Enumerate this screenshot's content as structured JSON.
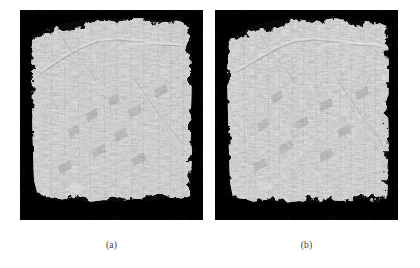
{
  "figure": {
    "type": "two-panel-grayscale-micrograph",
    "background_color": "#ffffff",
    "panel_background_color": "#050505",
    "specimen_base_color": "#9a9a9a",
    "caption_color": "#3a3a3a",
    "panels": [
      {
        "id": "a",
        "caption": "(a)",
        "description": "Grayscale fracture-surface micrograph of specimen, rough textured gray block on black background",
        "x": 20,
        "y": 10,
        "width": 183,
        "height": 210,
        "texture": "coarse vertical striations with raised flake ridges",
        "features": [
          "irregular jagged top edge against black background",
          "bright diagonal ridge crossing upper region from left to upper right",
          "bright horizontal crack line near top right",
          "raised angular flakes across mid and lower surface",
          "irregular dark bottom edge against black background"
        ]
      },
      {
        "id": "b",
        "caption": "(b)",
        "description": "Grayscale fracture-surface micrograph of specimen, finer denser texture on black background",
        "x": 215,
        "y": 10,
        "width": 183,
        "height": 210,
        "texture": "fine dense vertical striations with angular facets",
        "features": [
          "irregular jagged top edge against black background",
          "bright diagonal ridge crossing upper region from left to upper right",
          "bright horizontal crack line near top right",
          "star-like crossing fractures in lower mid region",
          "irregular dark bottom edge against black background"
        ]
      }
    ]
  }
}
